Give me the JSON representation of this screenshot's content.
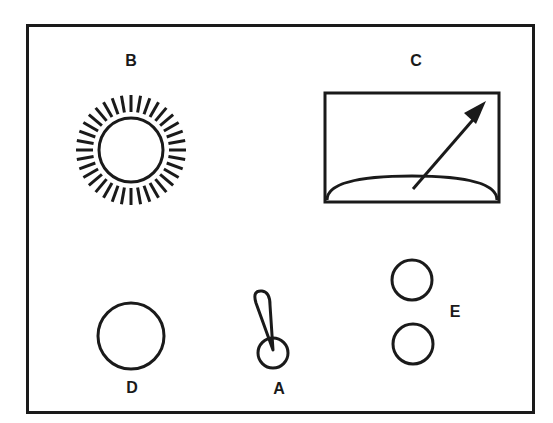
{
  "diagram": {
    "type": "control panel",
    "colors": {
      "stroke": "#1a1a1a",
      "background": "#ffffff"
    },
    "components": [
      {
        "id": "A",
        "label": "A",
        "kind": "toggle-switch"
      },
      {
        "id": "B",
        "label": "B",
        "kind": "indicator-light"
      },
      {
        "id": "C",
        "label": "C",
        "kind": "meter-gauge"
      },
      {
        "id": "D",
        "label": "D",
        "kind": "round-button"
      },
      {
        "id": "E",
        "label": "E",
        "kind": "pair-of-buttons"
      }
    ]
  }
}
